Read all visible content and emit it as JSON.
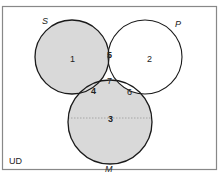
{
  "diagram": {
    "type": "venn",
    "universe_label": "UD",
    "sets": [
      {
        "name": "S",
        "cx": 72,
        "cy": 57,
        "r": 37
      },
      {
        "name": "P",
        "cx": 145,
        "cy": 57,
        "r": 37
      },
      {
        "name": "M",
        "cx": 110,
        "cy": 122,
        "r": 42
      }
    ],
    "regions": [
      {
        "id": "1",
        "label": "1",
        "shaded": true
      },
      {
        "id": "2",
        "label": "2",
        "shaded": false
      },
      {
        "id": "3",
        "label": "3",
        "shaded": true
      },
      {
        "id": "4",
        "label": "4",
        "shaded": true
      },
      {
        "id": "5",
        "label": "5",
        "shaded": true
      },
      {
        "id": "6",
        "label": "6",
        "shaded": false
      },
      {
        "id": "7",
        "label": "7",
        "shaded": false
      }
    ],
    "colors": {
      "shade": "#d9d9d9",
      "stroke": "#1a1a1a",
      "border": "#888888",
      "dotted_line": "#9a9a9a"
    },
    "annotations": {
      "dotted_line": "horizontal dotted line across region 3"
    }
  }
}
